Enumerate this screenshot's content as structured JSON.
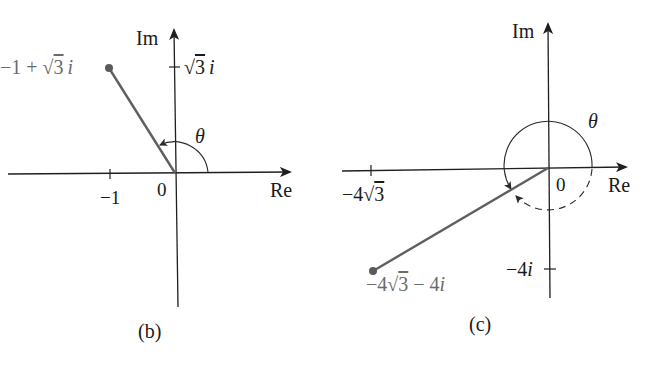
{
  "colors": {
    "axis": "#1f1f1f",
    "vector": "#5f5f5f",
    "point": "#5a5a5a",
    "point_label": "#6b6b6b",
    "text": "#1a1a1a"
  },
  "diagrams": [
    {
      "id": "b",
      "caption": "(b)",
      "axes": {
        "x_label": "Re",
        "y_label": "Im",
        "origin_label": "0"
      },
      "ticks": {
        "x": [
          {
            "value": -1,
            "label": "−1"
          }
        ],
        "y": [
          {
            "value": "√3",
            "label_prefix": "√",
            "label_num": "3",
            "label_i": "i"
          }
        ]
      },
      "point": {
        "re": -1,
        "im": 1.732,
        "label_prefix": "−1 + √",
        "label_num": "3",
        "label_i": "i"
      },
      "angle": {
        "symbol": "θ",
        "description": "arc from positive Re axis counter-clockwise to vector, 120°"
      }
    },
    {
      "id": "c",
      "caption": "(c)",
      "axes": {
        "x_label": "Re",
        "y_label": "Im",
        "origin_label": "0"
      },
      "ticks": {
        "x": [
          {
            "value": -6.93,
            "label_prefix": "−4√",
            "label_num": "3"
          }
        ],
        "y": [
          {
            "value": -4,
            "label": "−4",
            "label_i": "i"
          }
        ]
      },
      "point": {
        "re": -6.93,
        "im": -4,
        "label_prefix": "−4√",
        "label_num": "3",
        "label_rest": " − 4",
        "label_i": "i"
      },
      "angle": {
        "symbol": "θ",
        "description": "solid arc counter-clockwise from positive Re axis to vector (210°), dashed arc clockwise (−150°)"
      }
    }
  ]
}
